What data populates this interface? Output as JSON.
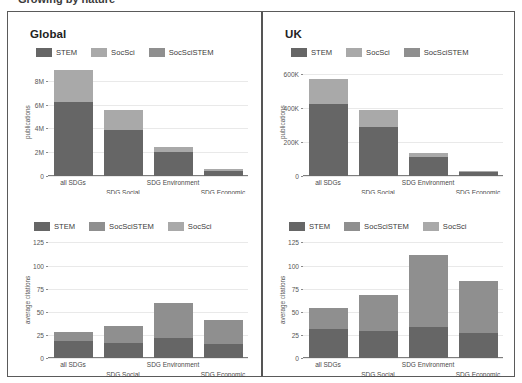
{
  "top_clipped_text": "Growing by nature",
  "colors": {
    "stem": "#666666",
    "socsci": "#a9a9a9",
    "socscistem": "#8f8f8f",
    "grid": "#e9e9e9",
    "axis": "#7d7d7d",
    "frame": "#5a5a5a",
    "text": "#3a3a3a"
  },
  "panels": {
    "top_left": {
      "title": "Global"
    },
    "top_right": {
      "title": "UK"
    },
    "bottom_left": {
      "title": ""
    },
    "bottom_right": {
      "title": ""
    }
  },
  "chart_data": [
    {
      "id": "global-publications",
      "type": "bar",
      "stacked": true,
      "title": "Global",
      "xlabel": "",
      "ylabel": "publications",
      "categories": [
        "all SDGs",
        "SDG Social",
        "SDG Environment",
        "SDG Economic"
      ],
      "ytick_labels": [
        "0",
        "2M",
        "4M",
        "6M",
        "8M"
      ],
      "ytick_values": [
        0,
        2000000,
        4000000,
        6000000,
        8000000
      ],
      "ylim": [
        0,
        9400000
      ],
      "grid": true,
      "legend_position": "top-left",
      "series": [
        {
          "name": "STEM",
          "color": "#666666",
          "values": [
            6200000,
            3850000,
            1980000,
            430000
          ]
        },
        {
          "name": "SocSci",
          "color": "#a9a9a9",
          "values": [
            2700000,
            1650000,
            470000,
            170000
          ]
        },
        {
          "name": "SocSciSTEM",
          "color": "#8f8f8f",
          "values": [
            0,
            0,
            0,
            0
          ]
        }
      ],
      "totals": [
        8900000,
        5500000,
        2450000,
        600000
      ]
    },
    {
      "id": "uk-publications",
      "type": "bar",
      "stacked": true,
      "title": "UK",
      "xlabel": "",
      "ylabel": "publications",
      "categories": [
        "all SDGs",
        "SDG Social",
        "SDG Environment",
        "SDG Economic"
      ],
      "ytick_labels": [
        "0",
        "200K",
        "400K",
        "600K"
      ],
      "ytick_values": [
        0,
        200000,
        400000,
        600000
      ],
      "ylim": [
        0,
        660000
      ],
      "grid": true,
      "legend_position": "top-left",
      "series": [
        {
          "name": "STEM",
          "color": "#666666",
          "values": [
            425000,
            287000,
            112000,
            22000
          ]
        },
        {
          "name": "SocSci",
          "color": "#a9a9a9",
          "values": [
            145000,
            105000,
            21000,
            8000
          ]
        },
        {
          "name": "SocSciSTEM",
          "color": "#8f8f8f",
          "values": [
            0,
            0,
            0,
            0
          ]
        }
      ],
      "totals": [
        570000,
        392000,
        133000,
        30000
      ]
    },
    {
      "id": "global-citations",
      "type": "bar",
      "stacked": true,
      "title": "",
      "xlabel": "",
      "ylabel": "average citations",
      "categories": [
        "all SDGs",
        "SDG Social",
        "SDG Environment",
        "SDG Economic"
      ],
      "ytick_labels": [
        "0",
        "25",
        "50",
        "75",
        "100",
        "125"
      ],
      "ytick_values": [
        0,
        25,
        50,
        75,
        100,
        125
      ],
      "ylim": [
        0,
        132
      ],
      "grid": true,
      "legend_position": "top-left",
      "series": [
        {
          "name": "STEM",
          "color": "#666666",
          "values": [
            18,
            16,
            22,
            15
          ]
        },
        {
          "name": "SocSciSTEM",
          "color": "#8f8f8f",
          "values": [
            10,
            19,
            38,
            26
          ]
        },
        {
          "name": "SocSci",
          "color": "#a9a9a9",
          "values": [
            0,
            0,
            0,
            0
          ]
        }
      ],
      "totals": [
        28,
        35,
        60,
        41
      ]
    },
    {
      "id": "uk-citations",
      "type": "bar",
      "stacked": true,
      "title": "",
      "xlabel": "",
      "ylabel": "average citations",
      "categories": [
        "all SDGs",
        "SDG Social",
        "SDG Environment",
        "SDG Economic"
      ],
      "ytick_labels": [
        "0",
        "25",
        "50",
        "75",
        "100",
        "125"
      ],
      "ytick_values": [
        0,
        25,
        50,
        75,
        100,
        125
      ],
      "ylim": [
        0,
        132
      ],
      "grid": true,
      "legend_position": "top-left",
      "series": [
        {
          "name": "STEM",
          "color": "#666666",
          "values": [
            31,
            29,
            34,
            27
          ]
        },
        {
          "name": "SocSciSTEM",
          "color": "#8f8f8f",
          "values": [
            23,
            39,
            77,
            56
          ]
        },
        {
          "name": "SocSci",
          "color": "#a9a9a9",
          "values": [
            0,
            0,
            0,
            0
          ]
        }
      ],
      "totals": [
        54,
        68,
        111,
        83
      ]
    }
  ]
}
